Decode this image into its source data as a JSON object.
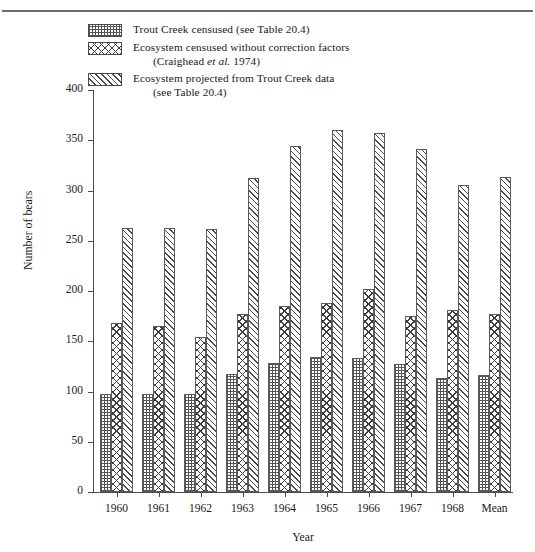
{
  "figure": {
    "axis_title_x": "Year",
    "axis_title_y": "Number of bears"
  },
  "legend": {
    "items": [
      {
        "pattern": "dots-swatch",
        "line1": "Trout Creek censused (see Table 20.4)",
        "line2": ""
      },
      {
        "pattern": "crosshatch-swatch",
        "line1": "Ecosystem censused without correction factors",
        "line2": "(Craighead et al. 1974)"
      },
      {
        "pattern": "diagonal-swatch",
        "line1": "Ecosystem projected from Trout Creek data",
        "line2": "(see Table 20.4)"
      }
    ]
  },
  "chart_data": {
    "type": "bar",
    "title": "",
    "xlabel": "Year",
    "ylabel": "Number of bears",
    "categories": [
      "1960",
      "1961",
      "1962",
      "1963",
      "1964",
      "1965",
      "1966",
      "1967",
      "1968",
      "Mean"
    ],
    "ylim": [
      0,
      400
    ],
    "yticks": [
      0,
      50,
      100,
      150,
      200,
      250,
      300,
      350,
      400
    ],
    "ytick_labels": [
      "0",
      "50",
      "100",
      "150",
      "200",
      "250",
      "300",
      "350",
      "400"
    ],
    "grid": false,
    "legend_position": "top-left",
    "series": [
      {
        "name": "Trout Creek censused (see Table 20.4)",
        "pattern": "dots",
        "values": [
          98,
          98,
          98,
          117,
          128,
          134,
          133,
          127,
          113,
          116
        ]
      },
      {
        "name": "Ecosystem censused without correction factors (Craighead et al. 1974)",
        "pattern": "crosshatch",
        "values": [
          168,
          165,
          154,
          177,
          185,
          188,
          202,
          175,
          181,
          177
        ]
      },
      {
        "name": "Ecosystem projected from Trout Creek data (see Table 20.4)",
        "pattern": "diagonal",
        "values": [
          263,
          263,
          262,
          312,
          344,
          360,
          357,
          341,
          305,
          313
        ]
      }
    ]
  }
}
